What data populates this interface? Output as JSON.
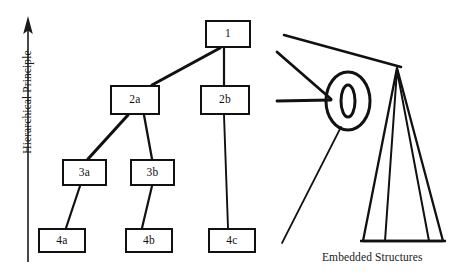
{
  "figure": {
    "axis": {
      "label": "Hierarchical Principle",
      "direction": "up",
      "arrow_icon": "arrow-up-icon"
    },
    "caption": "Embedded Structures",
    "tree": {
      "nodes": [
        {
          "id": "n1",
          "label": "1",
          "x": 205,
          "y": 20,
          "w": 46,
          "h": 28
        },
        {
          "id": "n2a",
          "label": "2a",
          "x": 110,
          "y": 85,
          "w": 50,
          "h": 30
        },
        {
          "id": "n2b",
          "label": "2b",
          "x": 200,
          "y": 85,
          "w": 50,
          "h": 30
        },
        {
          "id": "n3a",
          "label": "3a",
          "x": 62,
          "y": 159,
          "w": 45,
          "h": 27
        },
        {
          "id": "n3b",
          "label": "3b",
          "x": 130,
          "y": 159,
          "w": 45,
          "h": 27
        },
        {
          "id": "n4a",
          "label": "4a",
          "x": 38,
          "y": 228,
          "w": 48,
          "h": 25
        },
        {
          "id": "n4b",
          "label": "4b",
          "x": 125,
          "y": 228,
          "w": 48,
          "h": 25
        },
        {
          "id": "n4c",
          "label": "4c",
          "x": 208,
          "y": 228,
          "w": 48,
          "h": 25
        }
      ],
      "edges": [
        {
          "from": "n1",
          "to": "n2a",
          "x1": 220,
          "y1": 48,
          "x2": 152,
          "y2": 85
        },
        {
          "from": "n1",
          "to": "n2b",
          "x1": 224,
          "y1": 48,
          "x2": 224,
          "y2": 85
        },
        {
          "from": "n2a",
          "to": "n3a",
          "x1": 128,
          "y1": 115,
          "x2": 88,
          "y2": 159
        },
        {
          "from": "n2a",
          "to": "n3b",
          "x1": 144,
          "y1": 115,
          "x2": 152,
          "y2": 159
        },
        {
          "from": "n3a",
          "to": "n4a",
          "x1": 80,
          "y1": 186,
          "x2": 66,
          "y2": 228
        },
        {
          "from": "n3b",
          "to": "n4b",
          "x1": 152,
          "y1": 186,
          "x2": 142,
          "y2": 228
        },
        {
          "from": "n2b",
          "to": "n4c",
          "x1": 224,
          "y1": 115,
          "x2": 228,
          "y2": 228
        }
      ]
    },
    "embedded": {
      "ellipse_outer": {
        "cx": 348,
        "cy": 101,
        "rx": 22,
        "ry": 29
      },
      "ellipse_inner": {
        "cx": 348,
        "cy": 101,
        "rx": 7,
        "ry": 16
      },
      "pointer_lines": [
        {
          "x1": 284,
          "y1": 35,
          "x2": 401,
          "y2": 67
        },
        {
          "x1": 277,
          "y1": 52,
          "x2": 330,
          "y2": 99
        },
        {
          "x1": 277,
          "y1": 100,
          "x2": 330,
          "y2": 99
        },
        {
          "x1": 340,
          "y1": 128,
          "x2": 282,
          "y2": 243
        }
      ],
      "triangles": [
        {
          "apex_x": 397,
          "apex_y": 68,
          "base_left_x": 363,
          "base_right_x": 443,
          "base_y": 241
        },
        {
          "apex_x": 397,
          "apex_y": 70,
          "base_left_x": 385,
          "base_right_x": 429,
          "base_y": 241
        }
      ],
      "base_line": {
        "x1": 361,
        "y1": 241,
        "x2": 445,
        "y2": 241
      }
    }
  }
}
